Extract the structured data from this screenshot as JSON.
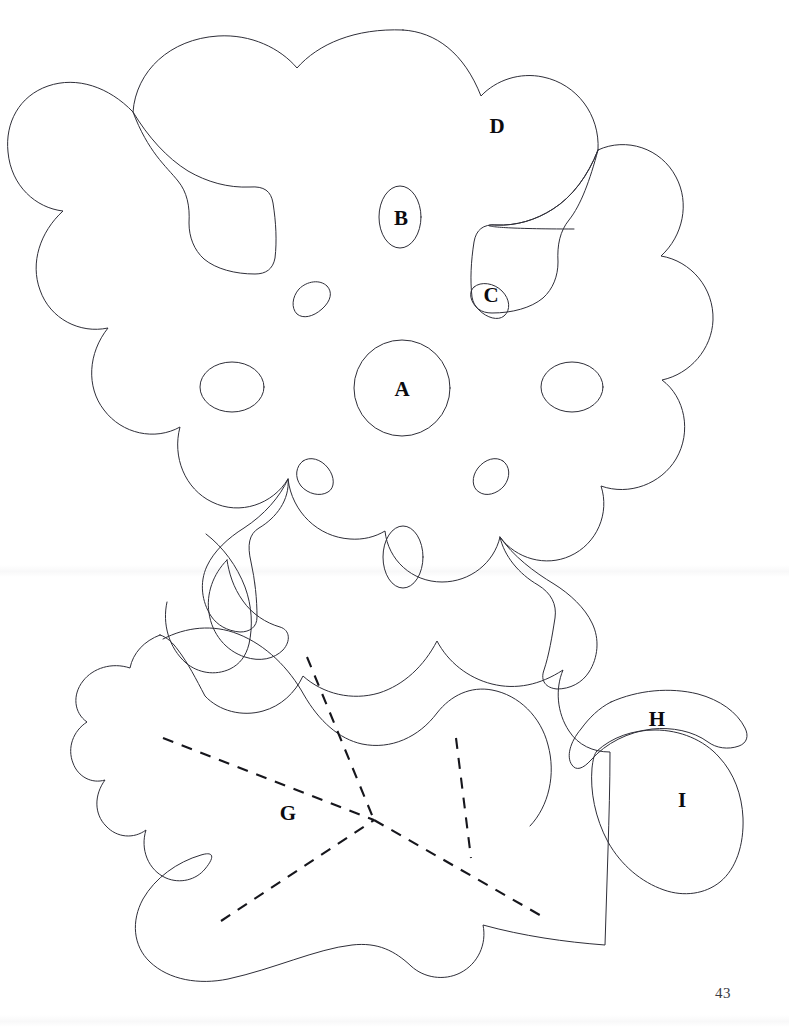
{
  "document": {
    "type": "line-drawing-plate",
    "page_number": "43",
    "background_color": "#ffffff",
    "stroke_color": "#2e2e38",
    "dash_color": "#16161c"
  },
  "figure": {
    "title": "",
    "labels": [
      {
        "id": "A",
        "text": "A",
        "x": 402,
        "y": 389,
        "target": "central-circular-opening"
      },
      {
        "id": "B",
        "text": "B",
        "x": 401,
        "y": 218,
        "target": "upper-oval-opening"
      },
      {
        "id": "C",
        "text": "C",
        "x": 491,
        "y": 295,
        "target": "upper-right-triangular-opening"
      },
      {
        "id": "D",
        "text": "D",
        "x": 497,
        "y": 126,
        "target": "main-lobed-body"
      },
      {
        "id": "G",
        "text": "G",
        "x": 288,
        "y": 813,
        "target": "lower-leaf-body"
      },
      {
        "id": "H",
        "text": "H",
        "x": 657,
        "y": 719,
        "target": "acorn-cap"
      },
      {
        "id": "I",
        "text": "I",
        "x": 682,
        "y": 800,
        "target": "acorn-body"
      }
    ],
    "shapes": [
      {
        "name": "main-lobed-body",
        "kind": "closed-outline",
        "label": "D"
      },
      {
        "name": "central-circular-opening",
        "kind": "circle",
        "cx": 402,
        "cy": 388,
        "r": 48,
        "label": "A"
      },
      {
        "name": "upper-oval-opening",
        "kind": "ellipse",
        "cx": 400,
        "cy": 217,
        "rx": 21,
        "ry": 31,
        "label": "B"
      },
      {
        "name": "left-oval-opening",
        "kind": "ellipse",
        "cx": 232,
        "cy": 387,
        "rx": 32,
        "ry": 25,
        "label": ""
      },
      {
        "name": "right-oval-opening",
        "kind": "ellipse",
        "cx": 572,
        "cy": 387,
        "rx": 31,
        "ry": 25,
        "label": ""
      },
      {
        "name": "lower-oval-opening",
        "kind": "ellipse",
        "cx": 403,
        "cy": 557,
        "rx": 20,
        "ry": 31,
        "label": ""
      },
      {
        "name": "upper-left-triangular-opening",
        "kind": "blob",
        "label": ""
      },
      {
        "name": "upper-right-triangular-opening",
        "kind": "blob",
        "label": "C"
      },
      {
        "name": "lower-left-triangular-opening",
        "kind": "blob",
        "label": ""
      },
      {
        "name": "lower-right-triangular-opening",
        "kind": "blob",
        "label": ""
      },
      {
        "name": "lower-leaf-body",
        "kind": "closed-outline",
        "label": "G"
      },
      {
        "name": "acorn-cap",
        "kind": "closed-outline",
        "label": "H"
      },
      {
        "name": "acorn-body",
        "kind": "closed-outline",
        "label": "I"
      }
    ],
    "dashed_lines": [
      {
        "name": "fold-line-upper",
        "from": [
          307,
          657
        ],
        "to": [
          374,
          820
        ]
      },
      {
        "name": "fold-line-left",
        "from": [
          163,
          738
        ],
        "to": [
          374,
          820
        ]
      },
      {
        "name": "fold-line-lower-left",
        "from": [
          221,
          921
        ],
        "to": [
          374,
          820
        ]
      },
      {
        "name": "fold-line-lower-right",
        "from": [
          374,
          820
        ],
        "to": [
          545,
          918
        ]
      },
      {
        "name": "fold-line-vertical",
        "from": [
          456,
          738
        ],
        "to": [
          471,
          858
        ]
      }
    ]
  }
}
